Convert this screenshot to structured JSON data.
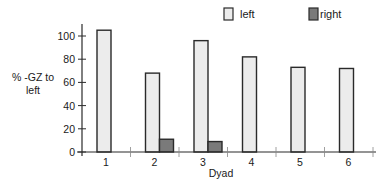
{
  "chart_data": {
    "type": "bar",
    "title": "",
    "xlabel": "Dyad",
    "ylabel": "% -GZ to left",
    "ylabel_lines": [
      "% -GZ to",
      "left"
    ],
    "categories": [
      "1",
      "2",
      "3",
      "4",
      "5",
      "6"
    ],
    "series": [
      {
        "name": "left",
        "values": [
          105,
          68,
          96,
          82,
          73,
          72
        ],
        "color": "#ececec"
      },
      {
        "name": "right",
        "values": [
          0,
          11,
          9,
          0,
          0,
          0
        ],
        "color": "#7a7a7a"
      }
    ],
    "yticks": [
      0,
      20,
      40,
      60,
      80,
      100
    ],
    "ytick_labels": [
      "0",
      "20",
      "40",
      "60",
      "80",
      "100"
    ],
    "ylim": [
      0,
      110
    ],
    "grid": false,
    "legend": {
      "position": "top-right",
      "entries": [
        "left",
        "right"
      ]
    },
    "bar_outline_color": "#2a2a2a",
    "axis_color": "#2a2a2a"
  }
}
